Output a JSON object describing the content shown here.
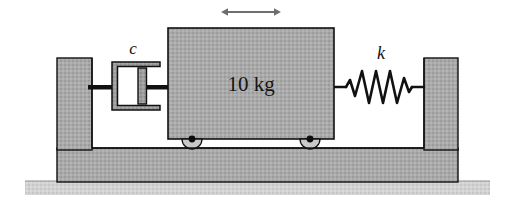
{
  "figure": {
    "type": "mechanical-schematic",
    "background_color": "#ffffff",
    "canvas": {
      "width": 505,
      "height": 203
    }
  },
  "labels": {
    "mass": "10 kg",
    "damper": "c",
    "spring": "k"
  },
  "components": {
    "mass_block": {
      "name": "10 kg",
      "fill_color": "#a8a8a8",
      "stroke_color": "#101010",
      "x": 168,
      "y": 28,
      "width": 166,
      "height": 111
    },
    "damper": {
      "name": "c",
      "type": "dashpot",
      "fill_color": "#9a9a9a",
      "stroke_color": "#101010",
      "x": 108,
      "y": 60,
      "width": 56,
      "height": 52
    },
    "spring": {
      "name": "k",
      "type": "coil-spring",
      "coil_count": 6,
      "stroke_color": "#101010",
      "x": 340,
      "y": 70,
      "width": 78,
      "height": 34
    },
    "left_wall": {
      "fill_color": "#a8a8a8",
      "stroke_color": "#101010",
      "x": 57,
      "y": 58,
      "width": 35,
      "height": 96
    },
    "right_wall": {
      "fill_color": "#a8a8a8",
      "stroke_color": "#101010",
      "x": 424,
      "y": 58,
      "width": 34,
      "height": 96
    },
    "base_slab": {
      "fill_color": "#a8a8a8",
      "stroke_color": "#101010",
      "x": 57,
      "y": 148,
      "width": 401,
      "height": 34
    },
    "ground_strip": {
      "fill_color": "#cfcfcf",
      "stroke_color": "#8a8a8a",
      "x": 25,
      "y": 181,
      "width": 465,
      "height": 14
    },
    "wheels": [
      {
        "cx": 192,
        "cy": 139,
        "r": 10,
        "dot_r": 3.4
      },
      {
        "cx": 310,
        "cy": 139,
        "r": 10,
        "dot_r": 3.4
      }
    ],
    "rods": [
      {
        "name": "damper-to-wall-rod",
        "x": 88,
        "y": 85,
        "width": 22,
        "height": 4
      },
      {
        "name": "damper-to-mass-rod",
        "x": 160,
        "y": 85,
        "width": 10,
        "height": 4
      },
      {
        "name": "piston-rod",
        "x": 136,
        "y": 85,
        "width": 30,
        "height": 4
      }
    ],
    "motion_arrow": {
      "name": "double-headed-horizontal-arrow",
      "direction": "bidirectional-horizontal",
      "stroke_color": "#6e6e6e",
      "x1": 226,
      "x2": 276,
      "y": 12
    }
  },
  "colors": {
    "hatched_gray": "#a8a8a8",
    "outline": "#101010",
    "ground": "#cfcfcf",
    "arrow": "#6e6e6e",
    "text": "#141414"
  }
}
